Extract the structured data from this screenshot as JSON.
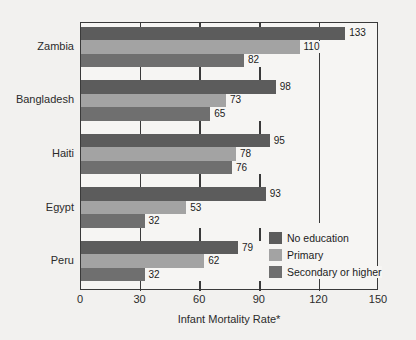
{
  "chart_data": {
    "type": "bar",
    "orientation": "horizontal",
    "title": "",
    "xlabel": "Infant Mortality Rate*",
    "ylabel": "",
    "xlim": [
      0,
      150
    ],
    "xticks": [
      0,
      30,
      60,
      90,
      120,
      150
    ],
    "grid": true,
    "grid_axis": "x",
    "legend_position": "lower-right-inside",
    "categories": [
      "Zambia",
      "Bangladesh",
      "Haiti",
      "Egypt",
      "Peru"
    ],
    "series": [
      {
        "name": "No education",
        "color": "#5c5c5c",
        "values": [
          133,
          98,
          95,
          93,
          79
        ]
      },
      {
        "name": "Primary",
        "color": "#a3a3a3",
        "values": [
          110,
          73,
          78,
          53,
          62
        ]
      },
      {
        "name": "Secondary or higher",
        "color": "#6f6f6f",
        "values": [
          82,
          65,
          76,
          32,
          32
        ]
      }
    ]
  },
  "axis": {
    "x_title": "Infant Mortality Rate*",
    "tick_labels": [
      "0",
      "30",
      "60",
      "90",
      "120",
      "150"
    ]
  },
  "legend": {
    "items": [
      {
        "label": "No education",
        "color": "#5c5c5c"
      },
      {
        "label": "Primary",
        "color": "#a3a3a3"
      },
      {
        "label": "Secondary or higher",
        "color": "#6f6f6f"
      }
    ]
  },
  "style": {
    "background": "#f2f1ef",
    "plot_background": "#f6f5f3",
    "axis_color": "#3a3a3a",
    "text_color": "#1c1c1c"
  }
}
